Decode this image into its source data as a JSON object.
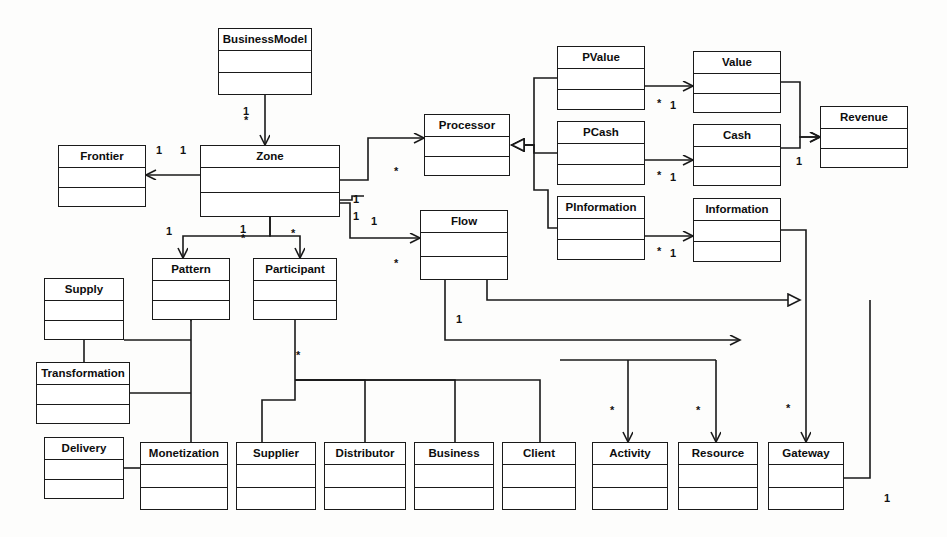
{
  "diagram": {
    "kind": "uml-class-diagram",
    "stroke_color": "#1a1a1a",
    "fill_color": "#ffffff",
    "background": "#fdfdfc"
  },
  "classes": [
    {
      "id": "businessmodel",
      "name": "BusinessModel",
      "x": 218,
      "y": 28,
      "w": 94,
      "h": 67
    },
    {
      "id": "frontier",
      "name": "Frontier",
      "x": 58,
      "y": 145,
      "w": 88,
      "h": 62
    },
    {
      "id": "zone",
      "name": "Zone",
      "x": 200,
      "y": 145,
      "w": 140,
      "h": 72
    },
    {
      "id": "processor",
      "name": "Processor",
      "x": 424,
      "y": 114,
      "w": 86,
      "h": 62
    },
    {
      "id": "flow",
      "name": "Flow",
      "x": 420,
      "y": 210,
      "w": 88,
      "h": 70
    },
    {
      "id": "pvalue",
      "name": "PValue",
      "x": 557,
      "y": 46,
      "w": 88,
      "h": 64
    },
    {
      "id": "pcash",
      "name": "PCash",
      "x": 557,
      "y": 121,
      "w": 88,
      "h": 64
    },
    {
      "id": "pinformation",
      "name": "PInformation",
      "x": 557,
      "y": 196,
      "w": 88,
      "h": 64
    },
    {
      "id": "value",
      "name": "Value",
      "x": 693,
      "y": 51,
      "w": 88,
      "h": 62
    },
    {
      "id": "cash",
      "name": "Cash",
      "x": 693,
      "y": 124,
      "w": 88,
      "h": 62
    },
    {
      "id": "information",
      "name": "Information",
      "x": 693,
      "y": 198,
      "w": 88,
      "h": 64
    },
    {
      "id": "revenue",
      "name": "Revenue",
      "x": 820,
      "y": 106,
      "w": 88,
      "h": 62
    },
    {
      "id": "pattern",
      "name": "Pattern",
      "x": 152,
      "y": 258,
      "w": 78,
      "h": 62
    },
    {
      "id": "participant",
      "name": "Participant",
      "x": 253,
      "y": 258,
      "w": 84,
      "h": 62
    },
    {
      "id": "supply",
      "name": "Supply",
      "x": 44,
      "y": 278,
      "w": 80,
      "h": 62
    },
    {
      "id": "transformation",
      "name": "Transformation",
      "x": 36,
      "y": 362,
      "w": 94,
      "h": 62
    },
    {
      "id": "delivery",
      "name": "Delivery",
      "x": 44,
      "y": 437,
      "w": 80,
      "h": 62
    },
    {
      "id": "monetization",
      "name": "Monetization",
      "x": 140,
      "y": 442,
      "w": 88,
      "h": 68
    },
    {
      "id": "supplier",
      "name": "Supplier",
      "x": 236,
      "y": 442,
      "w": 80,
      "h": 68
    },
    {
      "id": "distributor",
      "name": "Distributor",
      "x": 324,
      "y": 442,
      "w": 82,
      "h": 68
    },
    {
      "id": "business",
      "name": "Business",
      "x": 414,
      "y": 442,
      "w": 80,
      "h": 68
    },
    {
      "id": "client",
      "name": "Client",
      "x": 502,
      "y": 442,
      "w": 74,
      "h": 68
    },
    {
      "id": "activity",
      "name": "Activity",
      "x": 592,
      "y": 442,
      "w": 76,
      "h": 68
    },
    {
      "id": "resource",
      "name": "Resource",
      "x": 678,
      "y": 442,
      "w": 80,
      "h": 68
    },
    {
      "id": "gateway",
      "name": "Gateway",
      "x": 768,
      "y": 442,
      "w": 76,
      "h": 68
    }
  ],
  "multiplicities": [
    {
      "id": "m-bm-zone",
      "label": "1\n*",
      "x": 243,
      "y": 107,
      "stacked": true
    },
    {
      "id": "m-zone-front-l",
      "label": "1",
      "x": 156,
      "y": 145,
      "stacked": false
    },
    {
      "id": "m-zone-front-r",
      "label": "1",
      "x": 180,
      "y": 145,
      "stacked": false
    },
    {
      "id": "m-zone-proc",
      "label": "*",
      "x": 394,
      "y": 166,
      "stacked": false
    },
    {
      "id": "m-zone-pattern",
      "label": "1",
      "x": 166,
      "y": 226,
      "stacked": false
    },
    {
      "id": "m-zone-part-1",
      "label": "1\n*",
      "x": 240,
      "y": 225,
      "stacked": true
    },
    {
      "id": "m-zone-part-2",
      "label": "*",
      "x": 291,
      "y": 228,
      "stacked": false
    },
    {
      "id": "m-zone-flow-a",
      "label": "1",
      "x": 353,
      "y": 194,
      "stacked": false
    },
    {
      "id": "m-zone-flow-b",
      "label": "1",
      "x": 353,
      "y": 211,
      "stacked": false
    },
    {
      "id": "m-zone-flow-c",
      "label": "1",
      "x": 371,
      "y": 216,
      "stacked": false
    },
    {
      "id": "m-flow-star",
      "label": "*",
      "x": 394,
      "y": 258,
      "stacked": false
    },
    {
      "id": "m-pvalue-a",
      "label": "*",
      "x": 657,
      "y": 98,
      "stacked": false
    },
    {
      "id": "m-pvalue-b",
      "label": "1",
      "x": 670,
      "y": 100,
      "stacked": false
    },
    {
      "id": "m-pcash-a",
      "label": "*",
      "x": 657,
      "y": 170,
      "stacked": false
    },
    {
      "id": "m-pcash-b",
      "label": "1",
      "x": 670,
      "y": 172,
      "stacked": false
    },
    {
      "id": "m-pinfo-a",
      "label": "*",
      "x": 657,
      "y": 246,
      "stacked": false
    },
    {
      "id": "m-pinfo-b",
      "label": "1",
      "x": 670,
      "y": 248,
      "stacked": false
    },
    {
      "id": "m-revenue",
      "label": "1",
      "x": 796,
      "y": 156,
      "stacked": false
    },
    {
      "id": "m-part-inh",
      "label": "*",
      "x": 296,
      "y": 350,
      "stacked": false
    },
    {
      "id": "m-flow-bot",
      "label": "1",
      "x": 456,
      "y": 314,
      "stacked": false
    },
    {
      "id": "m-activity",
      "label": "*",
      "x": 610,
      "y": 405,
      "stacked": false
    },
    {
      "id": "m-resource",
      "label": "*",
      "x": 696,
      "y": 405,
      "stacked": false
    },
    {
      "id": "m-gateway",
      "label": "*",
      "x": 786,
      "y": 403,
      "stacked": false
    },
    {
      "id": "m-gateway-one",
      "label": "1",
      "x": 884,
      "y": 493,
      "stacked": false
    }
  ]
}
